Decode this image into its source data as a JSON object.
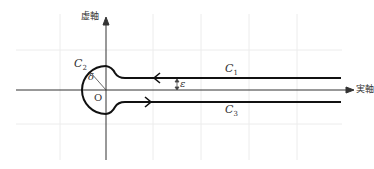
{
  "diagram": {
    "type": "keyhole-contour",
    "axes": {
      "imaginary_label": "虚軸",
      "real_label": "実軸",
      "origin_label": "O"
    },
    "contours": [
      {
        "id": "C1",
        "label": "C",
        "subscript": "1",
        "direction": "leftward",
        "position": "upper line"
      },
      {
        "id": "C2",
        "label": "C",
        "subscript": "2",
        "direction": "counterclockwise",
        "position": "circular arc around origin"
      },
      {
        "id": "C3",
        "label": "C",
        "subscript": "3",
        "direction": "rightward",
        "position": "lower line"
      }
    ],
    "annotations": {
      "radius_label": "δ",
      "gap_label": "ε"
    },
    "colors": {
      "contour": "#111111",
      "axis": "#333333",
      "grid": "#eeeeee"
    }
  }
}
